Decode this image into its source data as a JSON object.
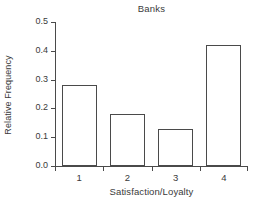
{
  "chart_data": {
    "type": "bar",
    "title": "Banks",
    "xlabel": "Satisfaction/Loyalty",
    "ylabel": "Relative Frequency",
    "categories": [
      "1",
      "2",
      "3",
      "4"
    ],
    "values": [
      0.28,
      0.18,
      0.13,
      0.42
    ],
    "ylim": [
      0.0,
      0.5
    ],
    "ytick_labels": [
      "0.0",
      "0.1",
      "0.2",
      "0.3",
      "0.4",
      "0.5"
    ],
    "ytick_values": [
      0.0,
      0.1,
      0.2,
      0.3,
      0.4,
      0.5
    ],
    "grid": false,
    "legend": "none",
    "bar_fill_color": "#ffffff",
    "bar_edge_color": "#4a4a4a",
    "axis_color": "#4a4a4a",
    "text_color": "#3a3a3a",
    "background_color": "#ffffff"
  }
}
